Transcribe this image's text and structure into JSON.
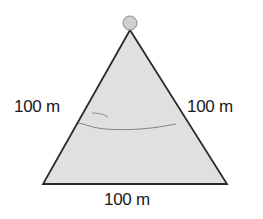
{
  "diagram": {
    "shape": "equilateral-triangle",
    "sides": {
      "left": "100 m",
      "right": "100 m",
      "bottom": "100 m"
    },
    "vertices": {
      "apex": [
        130,
        30
      ],
      "bottom_left": [
        43,
        184
      ],
      "bottom_right": [
        227,
        184
      ]
    },
    "apex_marker": {
      "type": "circle",
      "center": [
        130,
        23
      ],
      "radius": 7
    },
    "colors": {
      "fill": "#e0e0e0",
      "stroke": "#2a2a2a",
      "marker_fill": "#cfcfcf",
      "marker_stroke": "#8a8a8a",
      "sketch_line": "#6a6a6a",
      "text": "#1a1a1a"
    }
  }
}
